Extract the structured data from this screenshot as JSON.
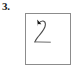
{
  "figure": {
    "item_number": "3.",
    "box": {
      "x": 25,
      "y": 13,
      "width": 46,
      "height": 52,
      "border_color": "#8c8c8c",
      "fill_color": "#ffffff"
    },
    "drawing": {
      "name": "handdrawn-digit-two-stroke",
      "described_as": "2",
      "stroke_color": "#4d4d4d",
      "stroke_width": 1.1,
      "start_marker": "arrowhead",
      "start_marker_color": "#1a1a1a",
      "path": "M 12.6 9.6 C 15.4 5.6 19.6 6.4 19.4 10.6 C 19.2 15.2 15.0 19.0 11.6 23.4 C 10.4 25.0 9.4 26.6 9.0 27.9",
      "baseline_path": "M 8.6 27.9 L 24.4 28.2",
      "arrowhead_points": "11.2,5.4 15.4,10.2 12.0,10.0 11.9,12.4"
    },
    "background_color": "#ffffff"
  }
}
